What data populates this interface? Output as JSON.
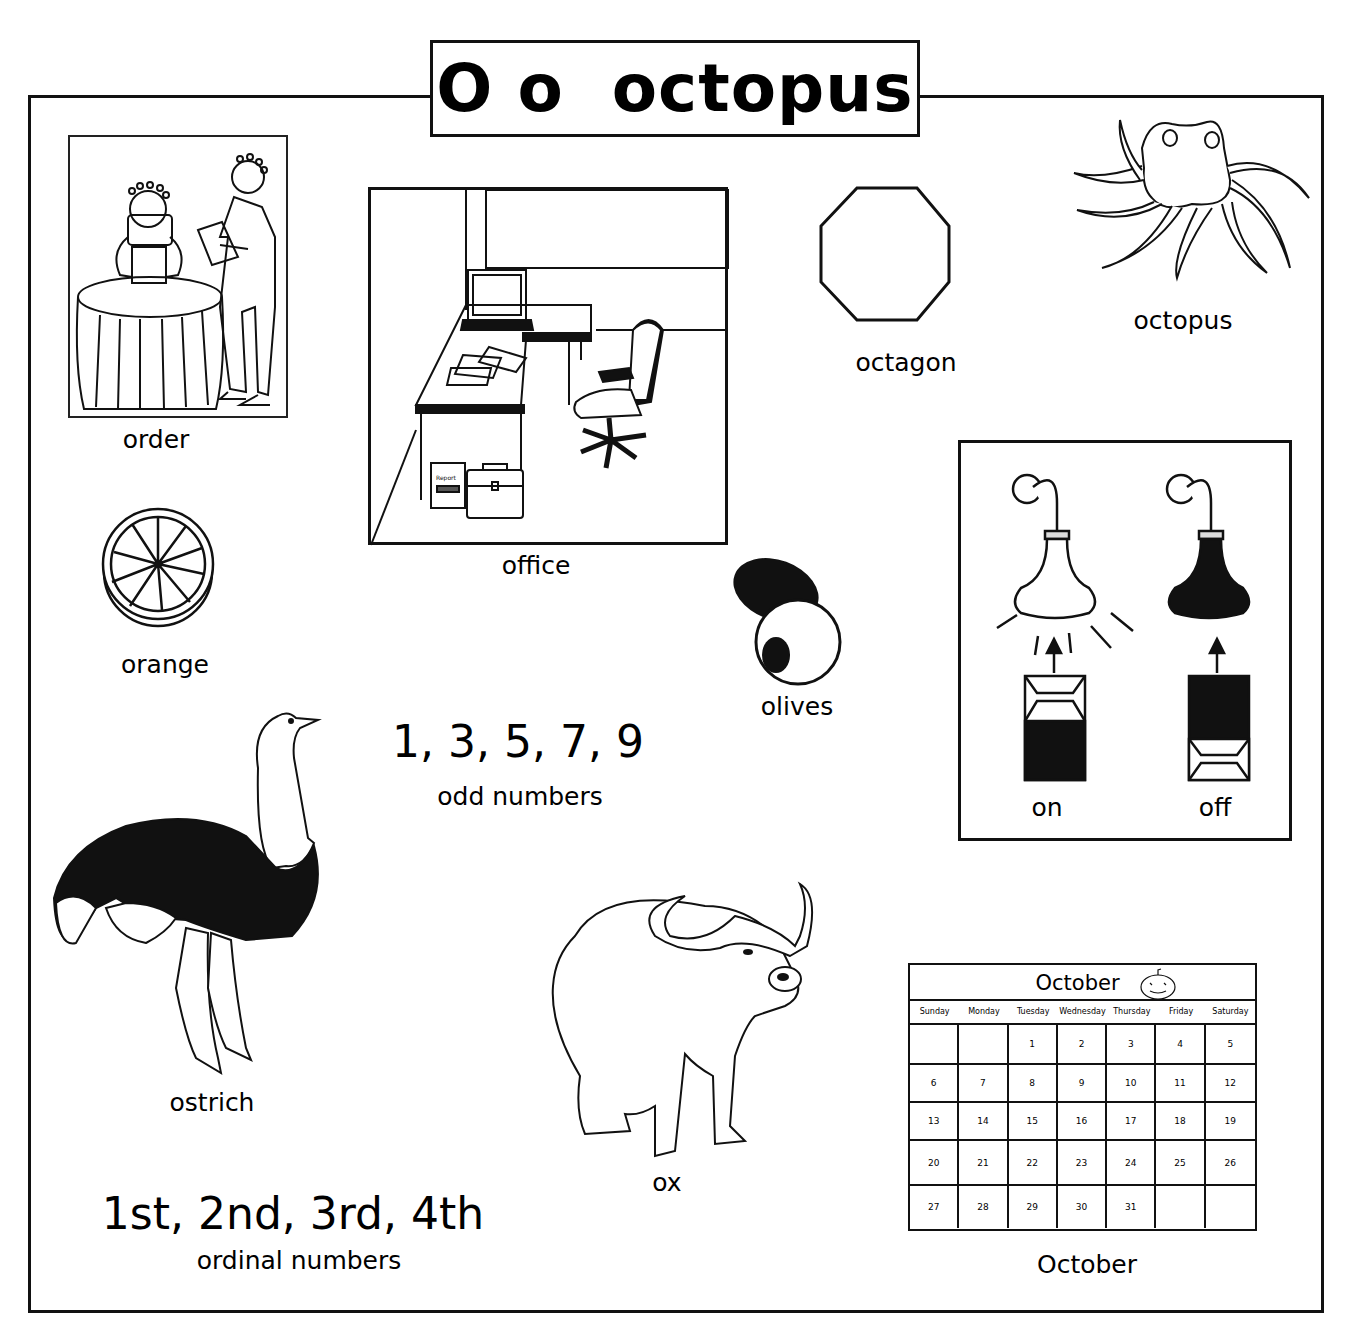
{
  "header": {
    "title": "O o  octopus",
    "letter_upper": "O",
    "letter_lower": "o",
    "keyword": "octopus"
  },
  "items": {
    "order": "order",
    "office": "office",
    "octagon": "octagon",
    "octopus": "octopus",
    "orange": "orange",
    "olives": "olives",
    "on": "on",
    "off": "off",
    "ostrich": "ostrich",
    "ox": "ox",
    "october": "October"
  },
  "office_scene": {
    "report_label": "Report"
  },
  "odd_numbers": {
    "values": "1, 3, 5, 7, 9",
    "caption": "odd numbers"
  },
  "ordinal_numbers": {
    "values": "1st, 2nd, 3rd, 4th",
    "caption": "ordinal numbers"
  },
  "calendar": {
    "month": "October",
    "icon": "pumpkin-icon",
    "day_names": [
      "Sunday",
      "Monday",
      "Tuesday",
      "Wednesday",
      "Thursday",
      "Friday",
      "Saturday"
    ],
    "cells": [
      "",
      "",
      "1",
      "2",
      "3",
      "4",
      "5",
      "6",
      "7",
      "8",
      "9",
      "10",
      "11",
      "12",
      "13",
      "14",
      "15",
      "16",
      "17",
      "18",
      "19",
      "20",
      "21",
      "22",
      "23",
      "24",
      "25",
      "26",
      "27",
      "28",
      "29",
      "30",
      "31",
      "",
      ""
    ]
  },
  "colors": {
    "ink": "#111111",
    "background": "#ffffff"
  }
}
